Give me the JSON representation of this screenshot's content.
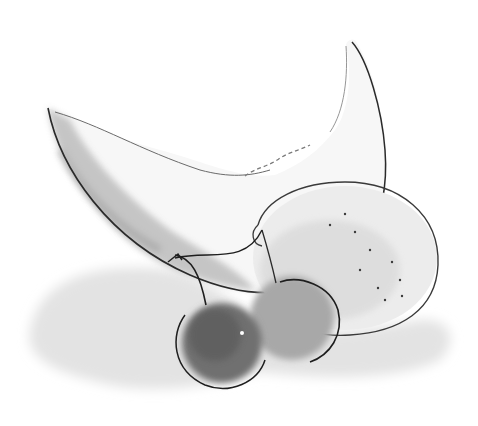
{
  "image": {
    "width": 478,
    "height": 426,
    "style": "grayscale watercolor and ink sketch",
    "background_color": "#ffffff"
  },
  "subjects": [
    {
      "name": "melon-slice",
      "description": "crescent melon wedge with mottled gray rind"
    },
    {
      "name": "lemon",
      "description": "round citrus with dotted skin, light gray wash"
    },
    {
      "name": "cherry-front",
      "description": "dark gray cherry with highlight, stem"
    },
    {
      "name": "cherry-back",
      "description": "medium gray cherry behind, stem"
    }
  ],
  "colors": {
    "ink": "#2a2a2a",
    "wash_light": "#d6d6d6",
    "wash_mid": "#b0b0b0",
    "wash_dark": "#6e6e6e",
    "shadow": "#e2e2e2"
  }
}
